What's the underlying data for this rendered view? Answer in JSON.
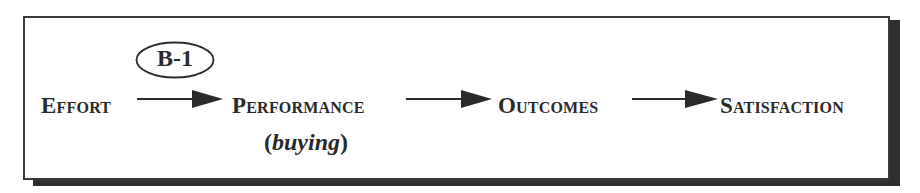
{
  "diagram": {
    "badge": {
      "label": "B-1"
    },
    "nodes": [
      {
        "label": "Effort"
      },
      {
        "label": "Performance",
        "sublabel_open": "(",
        "sublabel": "buying",
        "sublabel_close": ")"
      },
      {
        "label": "Outcomes"
      },
      {
        "label": "Satisfaction"
      }
    ],
    "edges": [
      {
        "from": "Effort",
        "to": "Performance"
      },
      {
        "from": "Performance",
        "to": "Outcomes"
      },
      {
        "from": "Outcomes",
        "to": "Satisfaction"
      }
    ],
    "colors": {
      "ink": "#2a2a2a",
      "shadow": "#2f2f2f",
      "background": "#ffffff"
    }
  }
}
